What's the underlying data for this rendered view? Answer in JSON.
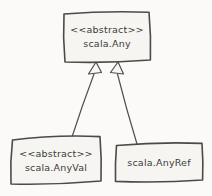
{
  "diagram": {
    "type": "uml-class-diagram",
    "background_color": "#fbfaf8",
    "box_fill_color": "#f6f5f1",
    "line_color": "#4a4a47",
    "text_color": "#3b3b39",
    "nodes": {
      "any": {
        "stereotype": "<<abstract>>",
        "name": "scala.Any"
      },
      "anyval": {
        "stereotype": "<<abstract>>",
        "name": "scala.AnyVal"
      },
      "anyref": {
        "name": "scala.AnyRef"
      }
    },
    "edges": [
      {
        "from": "scala.AnyVal",
        "to": "scala.Any",
        "relation": "generalization"
      },
      {
        "from": "scala.AnyRef",
        "to": "scala.Any",
        "relation": "generalization"
      }
    ]
  }
}
